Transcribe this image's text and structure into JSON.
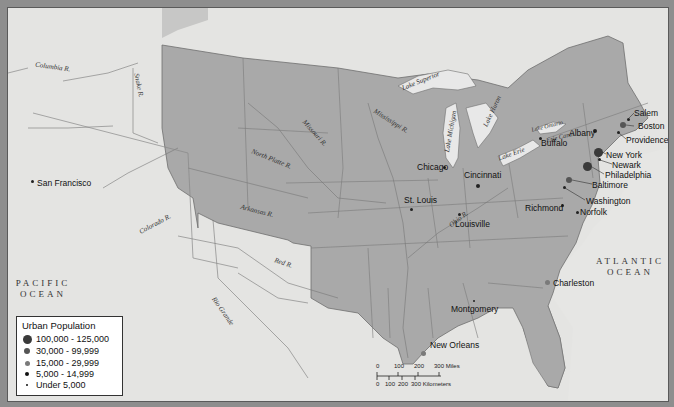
{
  "map": {
    "colors": {
      "frame": "#8e8e8e",
      "foreign_land": "#e4e4e2",
      "us_states": "#a9a9a9",
      "lakes": "#e8e8e8",
      "borders": "#6f6f6f",
      "city_dot": "#222222",
      "city_large": "#444444",
      "city_medium": "#6a6a6a"
    },
    "oceans": [
      {
        "name": "PACIFIC\nOCEAN"
      },
      {
        "name": "ATLANTIC\nOCEAN"
      }
    ],
    "rivers": [
      {
        "name": "Columbia R."
      },
      {
        "name": "Snake R."
      },
      {
        "name": "Missouri R."
      },
      {
        "name": "Mississippi R."
      },
      {
        "name": "North Platte R."
      },
      {
        "name": "Arkansas R."
      },
      {
        "name": "Colorado R."
      },
      {
        "name": "Red R."
      },
      {
        "name": "Rio Grande"
      },
      {
        "name": "Ohio R."
      }
    ],
    "lakes": [
      {
        "name": "Lake Superior"
      },
      {
        "name": "Lake Michigan"
      },
      {
        "name": "Lake Huron"
      },
      {
        "name": "Lake Erie"
      },
      {
        "name": "Lake Ontario"
      }
    ],
    "canals": [
      {
        "name": "Erie Canal"
      }
    ],
    "cities": [
      {
        "name": "San Francisco",
        "category": "under_5000"
      },
      {
        "name": "Chicago",
        "category": "under_5000"
      },
      {
        "name": "St. Louis",
        "category": "5000_14999"
      },
      {
        "name": "Cincinnati",
        "category": "30000_99999"
      },
      {
        "name": "Louisville",
        "category": "5000_14999"
      },
      {
        "name": "Buffalo",
        "category": "5000_14999"
      },
      {
        "name": "Albany",
        "category": "15000_29999"
      },
      {
        "name": "Salem",
        "category": "5000_14999"
      },
      {
        "name": "Boston",
        "category": "30000_99999"
      },
      {
        "name": "Providence",
        "category": "5000_14999"
      },
      {
        "name": "New York",
        "category": "100000_125000"
      },
      {
        "name": "Newark",
        "category": "5000_14999"
      },
      {
        "name": "Philadelphia",
        "category": "100000_125000"
      },
      {
        "name": "Baltimore",
        "category": "30000_99999"
      },
      {
        "name": "Washington",
        "category": "5000_14999"
      },
      {
        "name": "Richmond",
        "category": "5000_14999"
      },
      {
        "name": "Norfolk",
        "category": "5000_14999"
      },
      {
        "name": "Charleston",
        "category": "15000_29999"
      },
      {
        "name": "Montgomery",
        "category": "under_5000"
      },
      {
        "name": "New Orleans",
        "category": "15000_29999"
      }
    ]
  },
  "legend": {
    "title": "Urban Population",
    "items": [
      {
        "label": "100,000 - 125,000",
        "size": 9,
        "color": "#3a3a3a"
      },
      {
        "label": "30,000 - 99,999",
        "size": 6,
        "color": "#555555"
      },
      {
        "label": "15,000 - 29,999",
        "size": 5,
        "color": "#7a7a7a"
      },
      {
        "label": "5,000 - 14,999",
        "size": 4,
        "color": "#111111"
      },
      {
        "label": "Under 5,000",
        "size": 2.5,
        "color": "#111111"
      }
    ]
  },
  "scale_bar": {
    "miles_ticks": [
      "0",
      "100",
      "200",
      "300 Miles"
    ],
    "km_ticks": [
      "0",
      "100",
      "200",
      "300 Kilometers"
    ]
  }
}
